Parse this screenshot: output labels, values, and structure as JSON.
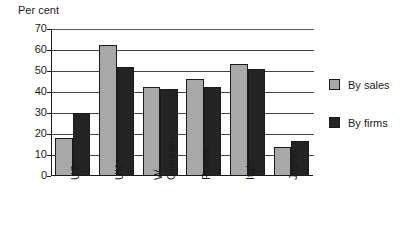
{
  "chart_data": {
    "type": "bar",
    "title": "",
    "ylabel": "Per cent",
    "xlabel": "",
    "ylim": [
      0,
      70
    ],
    "ytick_step": 10,
    "yticks": [
      "0",
      "10",
      "20",
      "30",
      "40",
      "50",
      "60",
      "70"
    ],
    "grid": true,
    "legend_position": "right",
    "categories": [
      "US",
      "UK",
      "W Germany",
      "France",
      "Italy",
      "Japan"
    ],
    "category_labels": [
      {
        "line1": "US",
        "line2": ""
      },
      {
        "line1": "UK",
        "line2": ""
      },
      {
        "line1": "W",
        "line2": "Germany"
      },
      {
        "line1": "France",
        "line2": ""
      },
      {
        "line1": "Italy",
        "line2": ""
      },
      {
        "line1": "Japan",
        "line2": ""
      }
    ],
    "series": [
      {
        "name": "By sales",
        "color": "#a8a8a8",
        "values": [
          18,
          62.5,
          42.5,
          46,
          53.5,
          14
        ]
      },
      {
        "name": "By firms",
        "color": "#242424",
        "values": [
          30,
          52,
          41.5,
          42.5,
          51,
          16.5
        ]
      }
    ]
  },
  "legend": {
    "entries": [
      {
        "label": "By sales",
        "swatch": "sales-swatch"
      },
      {
        "label": "By firms",
        "swatch": "firms-swatch"
      }
    ]
  },
  "axis": {
    "y_title": "Per cent"
  }
}
